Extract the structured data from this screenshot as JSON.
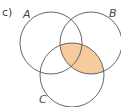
{
  "diagram": {
    "part_label": "c)",
    "sets": [
      {
        "name": "A",
        "cx": 51,
        "cy": 43,
        "r": 31
      },
      {
        "name": "B",
        "cx": 91,
        "cy": 43,
        "r": 31
      },
      {
        "name": "C",
        "cx": 72,
        "cy": 75,
        "r": 32
      }
    ],
    "shaded_region": "B ∩ C",
    "shade_color": "#f5c38e",
    "shade_stroke": "#e8a868",
    "stroke_color": "#555555"
  }
}
